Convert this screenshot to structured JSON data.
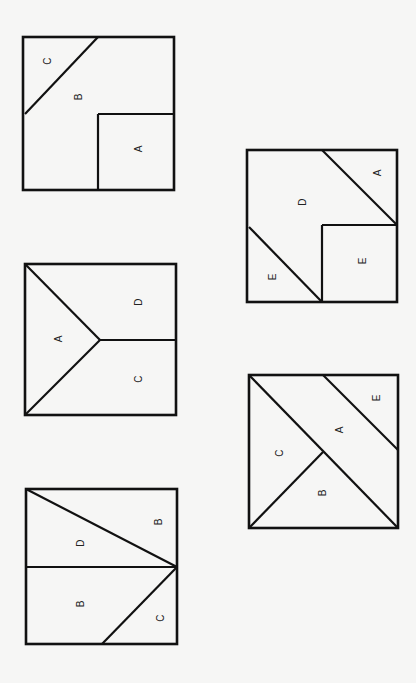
{
  "figure": {
    "background": "#f6f6f5",
    "line_color": "#111111",
    "label_rotation_deg": -90,
    "squares": [
      {
        "id": "square-1",
        "box": [
          23,
          37,
          151,
          153
        ],
        "segments": [
          [
            98,
            37,
            25,
            114
          ],
          [
            98,
            114,
            174,
            114
          ],
          [
            98,
            114,
            98,
            190
          ]
        ],
        "labels": [
          {
            "text": "C",
            "x": 47,
            "y": 61
          },
          {
            "text": "B",
            "x": 78,
            "y": 97
          },
          {
            "text": "A",
            "x": 138,
            "y": 149
          }
        ]
      },
      {
        "id": "square-2",
        "box": [
          247,
          150,
          150,
          152
        ],
        "segments": [
          [
            322,
            150,
            397,
            225
          ],
          [
            322,
            225,
            397,
            225
          ],
          [
            322,
            225,
            322,
            302
          ],
          [
            249,
            227,
            322,
            302
          ]
        ],
        "labels": [
          {
            "text": "A",
            "x": 377,
            "y": 173
          },
          {
            "text": "D",
            "x": 302,
            "y": 202
          },
          {
            "text": "E",
            "x": 362,
            "y": 261
          },
          {
            "text": "E",
            "x": 272,
            "y": 277
          }
        ]
      },
      {
        "id": "square-3",
        "box": [
          25,
          264,
          151,
          151
        ],
        "segments": [
          [
            25,
            264,
            100,
            340
          ],
          [
            100,
            340,
            25,
            415
          ],
          [
            100,
            340,
            176,
            340
          ]
        ],
        "labels": [
          {
            "text": "D",
            "x": 138,
            "y": 302
          },
          {
            "text": "A",
            "x": 58,
            "y": 339
          },
          {
            "text": "C",
            "x": 138,
            "y": 379
          }
        ]
      },
      {
        "id": "square-4",
        "box": [
          249,
          375,
          149,
          153
        ],
        "segments": [
          [
            249,
            375,
            398,
            528
          ],
          [
            323,
            375,
            398,
            450
          ],
          [
            323,
            452,
            249,
            528
          ]
        ],
        "labels": [
          {
            "text": "E",
            "x": 376,
            "y": 398
          },
          {
            "text": "A",
            "x": 339,
            "y": 430
          },
          {
            "text": "C",
            "x": 279,
            "y": 453
          },
          {
            "text": "B",
            "x": 322,
            "y": 493
          }
        ]
      },
      {
        "id": "square-5",
        "box": [
          26,
          489,
          151,
          155
        ],
        "segments": [
          [
            26,
            489,
            177,
            567
          ],
          [
            26,
            567,
            177,
            567
          ],
          [
            177,
            567,
            102,
            644
          ]
        ],
        "labels": [
          {
            "text": "B",
            "x": 158,
            "y": 522
          },
          {
            "text": "D",
            "x": 80,
            "y": 543
          },
          {
            "text": "B",
            "x": 80,
            "y": 604
          },
          {
            "text": "C",
            "x": 160,
            "y": 618
          }
        ]
      }
    ]
  }
}
